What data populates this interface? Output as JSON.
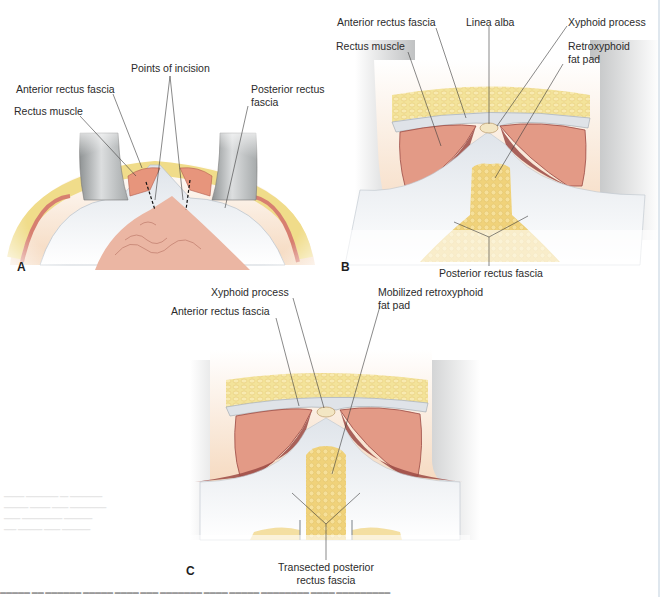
{
  "figure": {
    "panels": [
      {
        "id": "A",
        "letter": "A",
        "labels": {
          "points_of_incision": "Points of incision",
          "anterior_rectus_fascia": "Anterior rectus fascia",
          "rectus_muscle": "Rectus muscle",
          "posterior_rectus_fascia_line1": "Posterior rectus",
          "posterior_rectus_fascia_line2": "fascia"
        }
      },
      {
        "id": "B",
        "letter": "B",
        "labels": {
          "anterior_rectus_fascia": "Anterior rectus fascia",
          "linea_alba": "Linea alba",
          "xyphoid_process": "Xyphoid process",
          "rectus_muscle": "Rectus muscle",
          "retroxyphoid_line1": "Retroxyphoid",
          "retroxyphoid_line2": "fat pad",
          "posterior_rectus_fascia": "Posterior rectus fascia"
        }
      },
      {
        "id": "C",
        "letter": "C",
        "labels": {
          "xyphoid_process": "Xyphoid process",
          "mobilized_line1": "Mobilized retroxyphoid",
          "mobilized_line2": "fat pad",
          "anterior_rectus_fascia": "Anterior rectus fascia",
          "transected_line1": "Transected posterior",
          "transected_line2": "rectus fascia"
        }
      }
    ],
    "colors": {
      "skin": "#f6d9bf",
      "subcutaneous_fat": "#f2e08e",
      "fat_pad": "#f0d27a",
      "rectus_muscle": "#e39a86",
      "muscle_dark": "#9b4a44",
      "fascia": "#e8ecf0",
      "retractor": "#b9bcbd",
      "bowel": "#eab5a2",
      "label_text": "#2b2b2b",
      "leader_line": "#3a3a3a"
    }
  }
}
